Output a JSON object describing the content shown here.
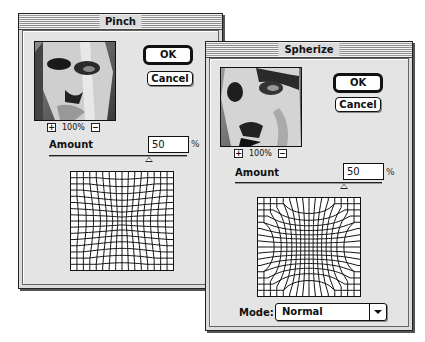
{
  "pinch_dialog": {
    "title": "Pinch",
    "ok_label": "OK",
    "cancel_label": "Cancel",
    "zoom_in_icon": "+",
    "zoom_out_icon": "−",
    "zoom_level": "100%",
    "amount_label": "Amount",
    "amount_value": "50",
    "amount_unit": "%",
    "slider_position_pct": 72,
    "grid": {
      "cells": 16,
      "distortion": "pinch"
    }
  },
  "spherize_dialog": {
    "title": "Spherize",
    "ok_label": "OK",
    "cancel_label": "Cancel",
    "zoom_in_icon": "+",
    "zoom_out_icon": "−",
    "zoom_level": "100%",
    "amount_label": "Amount",
    "amount_value": "50",
    "amount_unit": "%",
    "slider_position_pct": 72,
    "grid": {
      "cells": 16,
      "distortion": "spherize"
    },
    "mode_label": "Mode:",
    "mode_value": "Normal"
  }
}
